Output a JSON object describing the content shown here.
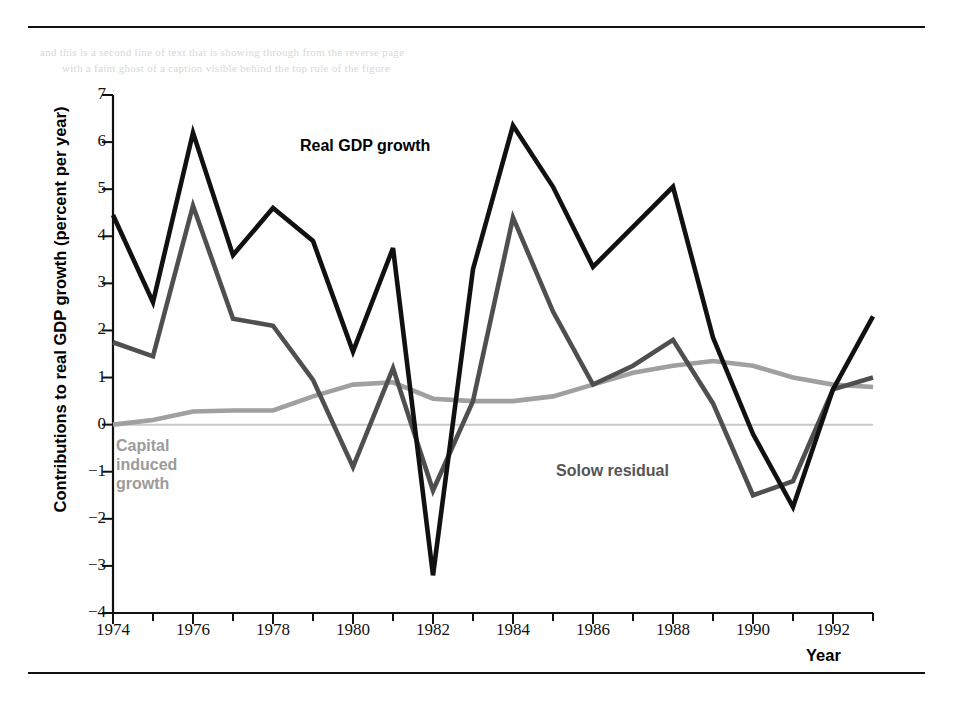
{
  "figure": {
    "bleed_text_line1": "and this is a second line of text that is showing through from the reverse page",
    "bleed_text_line2": "with a faint ghost of a caption visible behind the top rule of the figure"
  },
  "axes": {
    "ylabel": "Contributions to real GDP growth (percent per year)",
    "xlabel": "Year",
    "yticks": [
      "7",
      "6",
      "5",
      "4",
      "3",
      "2",
      "1",
      "0",
      "−1",
      "−2",
      "−3",
      "−4"
    ],
    "xticks": [
      "1974",
      "1976",
      "1978",
      "1980",
      "1982",
      "1984",
      "1986",
      "1988",
      "1990",
      "1992"
    ]
  },
  "annotations": {
    "real_gdp": "Real GDP growth",
    "capital": "Capital\ninduced\ngrowth",
    "solow": "Solow residual"
  },
  "colors": {
    "real_gdp": "#111111",
    "solow": "#4f4f4f",
    "capital": "#a0a0a0",
    "zero_line": "#c9c9c9",
    "axis": "#111111"
  },
  "chart_data": {
    "type": "line",
    "title": "",
    "xlabel": "Year",
    "ylabel": "Contributions to real GDP growth (percent per year)",
    "xlim": [
      1974,
      1993
    ],
    "ylim": [
      -4,
      7
    ],
    "grid": false,
    "legend_position": "inline-annotations",
    "x": [
      1974,
      1975,
      1976,
      1977,
      1978,
      1979,
      1980,
      1981,
      1982,
      1983,
      1984,
      1985,
      1986,
      1987,
      1988,
      1989,
      1990,
      1991,
      1992,
      1993
    ],
    "series": [
      {
        "name": "Real GDP growth",
        "color": "#111111",
        "values": [
          4.45,
          2.6,
          6.2,
          3.6,
          4.6,
          3.9,
          1.55,
          3.75,
          -3.2,
          3.3,
          6.35,
          5.05,
          3.35,
          4.2,
          5.05,
          1.85,
          -0.2,
          -1.75,
          0.75,
          2.3
        ]
      },
      {
        "name": "Solow residual",
        "color": "#4f4f4f",
        "values": [
          1.75,
          1.45,
          4.65,
          2.25,
          2.1,
          0.95,
          -0.9,
          1.2,
          -1.4,
          0.5,
          4.4,
          2.4,
          0.85,
          1.25,
          1.8,
          0.45,
          -1.5,
          -1.2,
          0.75,
          1.0
        ]
      },
      {
        "name": "Capital induced growth",
        "color": "#a0a0a0",
        "values": [
          0.0,
          0.1,
          0.28,
          0.3,
          0.3,
          0.6,
          0.85,
          0.9,
          0.55,
          0.5,
          0.5,
          0.6,
          0.85,
          1.1,
          1.25,
          1.35,
          1.25,
          1.0,
          0.85,
          0.8
        ]
      }
    ]
  }
}
